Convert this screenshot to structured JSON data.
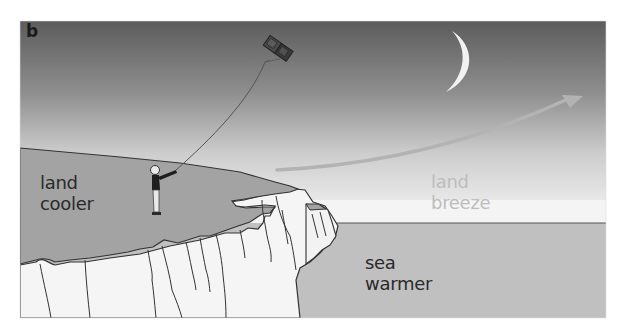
{
  "figure": {
    "panel_letter": "b",
    "colors": {
      "sky_top": "#5e5e5e",
      "sky_bottom": "#f4f4f4",
      "land": "#a3a3a3",
      "sea": "#c0c0c0",
      "cliff": "#f5f5f5",
      "outline": "#333333",
      "moon": "#f2f2f2",
      "arrow": "#b5b5b5",
      "breeze_text": "#bdbdbd",
      "label_text": "#2a2a2a"
    }
  },
  "labels": {
    "land": {
      "line1": "land",
      "line2": "cooler"
    },
    "breeze": {
      "line1": "land",
      "line2": "breeze"
    },
    "sea": {
      "line1": "sea",
      "line2": "warmer"
    }
  },
  "elements": {
    "moon": "crescent-moon",
    "kite": "box-kite",
    "person": "person-flying-kite",
    "arrow": "land-breeze-arrow",
    "cliff": "chalk-cliff"
  }
}
